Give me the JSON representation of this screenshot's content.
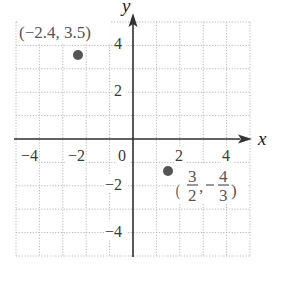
{
  "chart_data": {
    "type": "scatter",
    "title": "",
    "xlabel": "x",
    "ylabel": "y",
    "xlim": [
      -5,
      5
    ],
    "ylim": [
      -5,
      5
    ],
    "grid": true,
    "grid_step": 1,
    "x_ticks": [
      -4,
      -2,
      0,
      2,
      4
    ],
    "y_ticks": [
      4,
      2,
      -2,
      -4
    ],
    "x_tick_labels": [
      "−4",
      "−2",
      "0",
      "2",
      "4"
    ],
    "y_tick_labels": [
      "4",
      "2",
      "−2",
      "−4"
    ],
    "points": [
      {
        "x": -2.4,
        "y": 3.5,
        "label": "(−2.4, 3.5)"
      },
      {
        "x": 1.5,
        "y": -1.3333,
        "label": "(3/2, −4/3)",
        "label_num_x": "3",
        "label_den_x": "2",
        "label_num_y": "4",
        "label_den_y": "3"
      }
    ],
    "colors": {
      "point": "#555555",
      "grid": "#b8b8b8",
      "axis": "#333333"
    }
  }
}
